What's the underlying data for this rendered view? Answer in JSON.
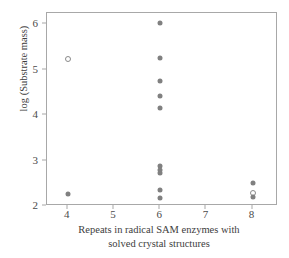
{
  "chart_data": {
    "type": "scatter",
    "title": "",
    "xlabel": "Repeats in radical SAM enzymes with solved crystal structures",
    "xlabel_line1": "Repeats in radical SAM enzymes with",
    "xlabel_line2": "solved crystal structures",
    "ylabel": "log (Substrate mass)",
    "xlim": [
      3.55,
      8.55
    ],
    "ylim": [
      2.0,
      6.25
    ],
    "xticks": [
      4,
      5,
      6,
      7,
      8
    ],
    "xtick_labels": [
      "4",
      "5",
      "6",
      "7",
      "8"
    ],
    "yticks": [
      2,
      3,
      4,
      5,
      6
    ],
    "ytick_labels": [
      "2",
      "3",
      "4",
      "5",
      "6"
    ],
    "grid": false,
    "legend": null,
    "marker_color": "#808080",
    "frame_color": "#a8a8a8",
    "points": [
      {
        "x": 4,
        "y": 5.23,
        "style": "open"
      },
      {
        "x": 4,
        "y": 2.26,
        "style": "filled"
      },
      {
        "x": 6,
        "y": 6.02,
        "style": "filled"
      },
      {
        "x": 6,
        "y": 5.25,
        "style": "filled"
      },
      {
        "x": 6,
        "y": 4.75,
        "style": "filled"
      },
      {
        "x": 6,
        "y": 4.42,
        "style": "filled"
      },
      {
        "x": 6,
        "y": 4.15,
        "style": "filled"
      },
      {
        "x": 6,
        "y": 2.88,
        "style": "filled"
      },
      {
        "x": 6,
        "y": 2.8,
        "style": "filled"
      },
      {
        "x": 6,
        "y": 2.73,
        "style": "filled"
      },
      {
        "x": 6,
        "y": 2.35,
        "style": "filled"
      },
      {
        "x": 6,
        "y": 2.18,
        "style": "filled"
      },
      {
        "x": 8,
        "y": 2.5,
        "style": "filled"
      },
      {
        "x": 8,
        "y": 2.29,
        "style": "open"
      },
      {
        "x": 8,
        "y": 2.19,
        "style": "filled"
      }
    ]
  }
}
